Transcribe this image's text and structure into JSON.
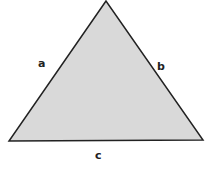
{
  "diagram": {
    "type": "triangle",
    "fill": "#d9d9d9",
    "stroke": "#222222",
    "vertices": {
      "apex": [
        106,
        1
      ],
      "bottom_left": [
        9,
        141
      ],
      "bottom_right": [
        203,
        140
      ]
    },
    "labels": {
      "a": "a",
      "b": "b",
      "c": "c"
    }
  }
}
